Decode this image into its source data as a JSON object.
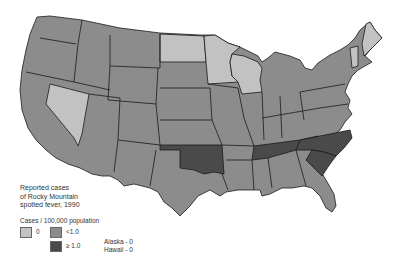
{
  "map": {
    "title": "Reported cases\nof Rocky Mountain\nspotted fever, 1990",
    "legend": {
      "units": "Cases / 100,000 population",
      "classes": [
        {
          "label": "0",
          "color": "#c2c2c2"
        },
        {
          "label": "<1.0",
          "color": "#8c8c8c"
        },
        {
          "label": "≥ 1.0",
          "color": "#4a4a4a"
        }
      ]
    },
    "notes": "Alaska - 0\nHawaii - 0",
    "states_zero": [
      "Maine",
      "Vermont",
      "Minnesota",
      "North Dakota",
      "Wisconsin",
      "Nevada"
    ],
    "states_high": [
      "Oklahoma",
      "Tennessee",
      "North Carolina",
      "South Carolina"
    ],
    "states_low_note": "All other contiguous states <1.0"
  }
}
